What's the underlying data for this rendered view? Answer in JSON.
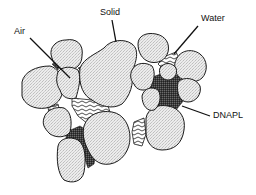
{
  "diagram": {
    "type": "pore-scale schematic",
    "labels": {
      "air": "Air",
      "solid": "Solid",
      "water": "Water",
      "dnapl": "DNAPL"
    },
    "phases": [
      {
        "name": "Solid",
        "pattern": "stippled light gray",
        "color": "#e4e4e4"
      },
      {
        "name": "Air",
        "pattern": "white (empty pore)",
        "color": "#ffffff"
      },
      {
        "name": "Water",
        "pattern": "wavy lines",
        "color": "#ffffff"
      },
      {
        "name": "DNAPL",
        "pattern": "dark stipple",
        "color": "#3a3a3a"
      }
    ]
  }
}
